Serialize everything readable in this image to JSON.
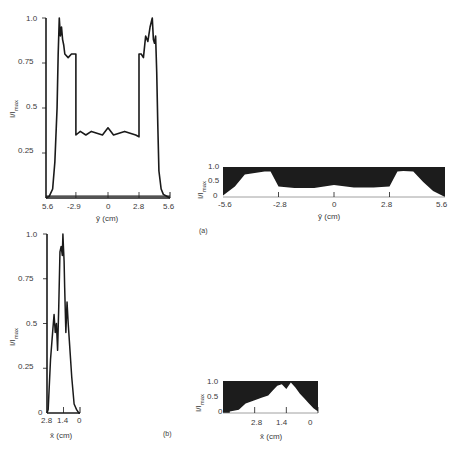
{
  "chart_data": [
    {
      "id": "a-line",
      "type": "line",
      "title": "",
      "xlabel": "ȳ (cm)",
      "ylabel": "I/I_max",
      "x_ticks": [
        "5.6",
        "-2.9",
        "0",
        "2.8",
        "5.6"
      ],
      "y_ticks": [
        "1.0",
        "0.75",
        "0.5",
        "0.25"
      ],
      "ylim": [
        0,
        1.0
      ],
      "xlim": [
        -5.6,
        5.6
      ],
      "series": [
        {
          "name": "intensity profile",
          "x": [
            -5.6,
            -5.3,
            -5.0,
            -4.8,
            -4.6,
            -4.5,
            -4.4,
            -4.3,
            -4.2,
            -4.1,
            -4.0,
            -3.9,
            -3.6,
            -3.3,
            -3.0,
            -2.9,
            -2.9,
            -2.5,
            -2.0,
            -1.5,
            -1.0,
            -0.5,
            0,
            0.5,
            1.0,
            1.5,
            2.0,
            2.5,
            2.8,
            2.8,
            3.0,
            3.2,
            3.4,
            3.6,
            3.8,
            4.0,
            4.1,
            4.2,
            4.3,
            4.4,
            4.5,
            4.6,
            4.8,
            5.0,
            5.3,
            5.6
          ],
          "y": [
            0.0,
            0.01,
            0.05,
            0.2,
            0.5,
            0.8,
            1.0,
            0.9,
            0.95,
            0.88,
            0.85,
            0.8,
            0.78,
            0.8,
            0.8,
            0.8,
            0.35,
            0.37,
            0.35,
            0.37,
            0.36,
            0.35,
            0.39,
            0.35,
            0.36,
            0.37,
            0.36,
            0.35,
            0.34,
            0.8,
            0.8,
            0.78,
            0.9,
            0.87,
            0.95,
            1.0,
            0.88,
            0.86,
            0.9,
            0.7,
            0.4,
            0.15,
            0.05,
            0.02,
            0.01,
            0.0
          ]
        },
        {
          "name": "baseline",
          "x": [
            -5.6,
            5.6
          ],
          "y": [
            0.01,
            0.01
          ]
        }
      ]
    },
    {
      "id": "a-area",
      "type": "area",
      "xlabel": "ȳ (cm)",
      "ylabel": "I/I_max",
      "x_ticks": [
        "-5.6",
        "-2.8",
        "0",
        "2.8",
        "5.6"
      ],
      "y_ticks": [
        "1.0",
        "0.5",
        "0"
      ],
      "ylim": [
        0,
        1.0
      ],
      "xlim": [
        -5.6,
        5.6
      ],
      "panel_label": "(a)",
      "series": [
        {
          "name": "intensity profile",
          "x": [
            -5.6,
            -5.0,
            -4.5,
            -4.0,
            -3.5,
            -3.2,
            -3.0,
            -2.8,
            -2.0,
            -1.0,
            0,
            1.0,
            2.0,
            2.8,
            3.0,
            3.2,
            3.5,
            4.0,
            4.5,
            5.0,
            5.6
          ],
          "y": [
            0.05,
            0.35,
            0.75,
            0.8,
            0.85,
            0.85,
            0.6,
            0.35,
            0.3,
            0.3,
            0.4,
            0.32,
            0.32,
            0.35,
            0.6,
            0.85,
            0.87,
            0.85,
            0.5,
            0.2,
            0.0
          ]
        }
      ]
    },
    {
      "id": "b-line",
      "type": "line",
      "xlabel": "x̄ (cm)",
      "ylabel": "I/I_max",
      "x_ticks": [
        "2.8",
        "1.4",
        "0"
      ],
      "y_ticks": [
        "1.0",
        "0.75",
        "0.5",
        "0.25",
        "0"
      ],
      "ylim": [
        0,
        1.0
      ],
      "xlim": [
        2.8,
        0
      ],
      "series": [
        {
          "name": "intensity profile",
          "x": [
            2.8,
            2.7,
            2.5,
            2.3,
            2.2,
            2.1,
            2.0,
            1.9,
            1.8,
            1.7,
            1.6,
            1.5,
            1.45,
            1.4,
            1.35,
            1.3,
            1.2,
            1.1,
            1.0,
            0.9,
            0.7,
            0.5,
            0.3,
            0.1,
            0
          ],
          "y": [
            0.0,
            0.02,
            0.3,
            0.47,
            0.55,
            0.45,
            0.5,
            0.35,
            0.6,
            0.9,
            0.93,
            0.88,
            1.0,
            0.92,
            0.85,
            0.7,
            0.45,
            0.62,
            0.5,
            0.4,
            0.2,
            0.05,
            0.02,
            0.0,
            0.0
          ]
        }
      ]
    },
    {
      "id": "b-area",
      "type": "area",
      "xlabel": "x̄ (cm)",
      "ylabel": "I/I_max",
      "x_ticks": [
        "2.8",
        "1.4",
        "0"
      ],
      "y_ticks": [
        "1.0",
        "0.5",
        "0"
      ],
      "ylim": [
        0,
        1.0
      ],
      "xlim": [
        4.2,
        0
      ],
      "panel_label": "(b)",
      "series": [
        {
          "name": "intensity profile",
          "x": [
            3.9,
            3.5,
            3.2,
            2.8,
            2.5,
            2.2,
            2.0,
            1.8,
            1.6,
            1.4,
            1.2,
            1.0,
            0.8,
            0.6,
            0.4,
            0.2,
            0
          ],
          "y": [
            0.05,
            0.1,
            0.3,
            0.4,
            0.48,
            0.55,
            0.7,
            0.85,
            0.9,
            0.75,
            0.95,
            0.8,
            0.6,
            0.45,
            0.3,
            0.15,
            0.05
          ]
        }
      ]
    }
  ],
  "labels": {
    "ylabel_base": "I/I",
    "ylabel_sub": "max",
    "panel_a": "(a)",
    "panel_b": "(b)",
    "a_line_xlabel": "ȳ (cm)",
    "a_area_xlabel": "ȳ (cm)",
    "b_line_xlabel": "x̄ (cm)",
    "b_area_xlabel": "x̄ (cm)",
    "a_line_yticks": [
      "1.0",
      "0.75",
      "0.5",
      "0.25"
    ],
    "a_line_xticks": [
      "5.6",
      "-2.9",
      "0",
      "2.8",
      "5.6"
    ],
    "a_area_yticks": [
      "1.0",
      "0.5",
      "0"
    ],
    "a_area_xticks": [
      "-5.6",
      "-2.8",
      "0",
      "2.8",
      "5.6"
    ],
    "b_line_yticks": [
      "1.0",
      "0.75",
      "0.5",
      "0.25",
      "0"
    ],
    "b_line_xticks": [
      "2.8",
      "1.4",
      "0"
    ],
    "b_area_yticks": [
      "1.0",
      "0.5",
      "0"
    ],
    "b_area_xticks": [
      "2.8",
      "1.4",
      "0"
    ]
  },
  "colors": {
    "ink": "#1a1a1a",
    "text": "#3a3a3a",
    "fill": "#1c1c1c",
    "background": "#ffffff"
  }
}
